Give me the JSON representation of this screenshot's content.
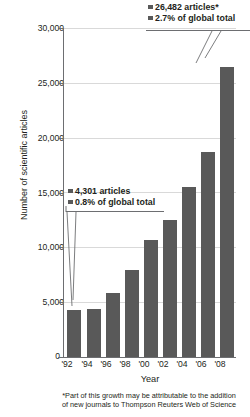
{
  "chart_data": {
    "type": "bar",
    "title": "",
    "xlabel": "Year",
    "ylabel": "Number of scientific articles",
    "categories": [
      "'92",
      "'94",
      "'96",
      "'98",
      "'00",
      "'02",
      "'04",
      "'06",
      "'08"
    ],
    "values": [
      4301,
      4350,
      5800,
      7900,
      10700,
      12500,
      15500,
      18700,
      26482
    ],
    "ylim": [
      0,
      30000
    ],
    "yticks": [
      0,
      5000,
      10000,
      15000,
      20000,
      25000,
      30000
    ],
    "ytick_labels": [
      "0",
      "5,000",
      "10,000",
      "15,000",
      "20,000",
      "25,000",
      "30,000"
    ],
    "grid": true,
    "legend": "none",
    "bar_color": "#595959",
    "annotations": [
      {
        "id": "first-bar-callout",
        "target_category": "'92",
        "lines": [
          "4,301 articles",
          "0.8% of global total"
        ]
      },
      {
        "id": "last-bar-callout",
        "target_category": "'08",
        "lines": [
          "26,482 articles*",
          "2.7% of global total"
        ]
      }
    ],
    "footnote": "*Part of this growth may be attributable to the addition of new journals to Thompson Reuters Web of Science"
  },
  "axis": {
    "y_title": "Number of scientific articles",
    "x_title": "Year"
  },
  "annotation_top": {
    "line1": "26,482 articles*",
    "line2": "2.7% of global total"
  },
  "annotation_low": {
    "line1": "4,301 articles",
    "line2": "0.8% of global total"
  },
  "footnote": {
    "line1": "*Part of this growth may be attributable to the addition",
    "line2": "of new journals to Thompson Reuters Web of Science"
  },
  "colors": {
    "bar": "#595959",
    "grid": "#d9d9d9",
    "axis": "#6d6e71",
    "text": "#231f20"
  }
}
